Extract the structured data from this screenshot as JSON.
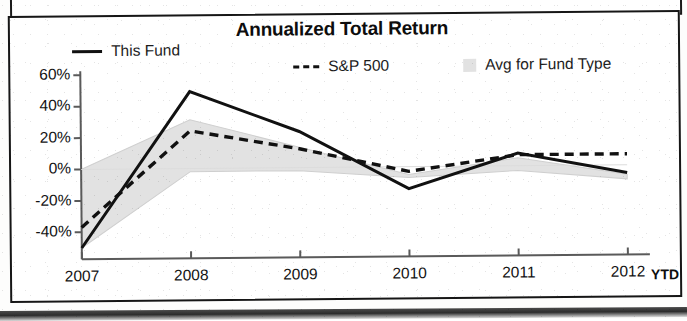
{
  "chart_data": {
    "type": "line",
    "title": "Annualized Total Return",
    "xlabel": "",
    "ylabel": "",
    "categories": [
      "2007",
      "2008",
      "2009",
      "2010",
      "2011",
      "2012"
    ],
    "x_axis_suffix": "YTD",
    "ylim": [
      -60,
      60
    ],
    "ytick_labels": [
      "60%",
      "40%",
      "20%",
      "0%",
      "-20%",
      "-40%"
    ],
    "ytick_values": [
      60,
      40,
      20,
      0,
      -20,
      -40
    ],
    "grid": false,
    "legend_position": "top",
    "series": [
      {
        "name": "This Fund",
        "style": "solid",
        "color": "#111111",
        "values": [
          -50,
          49,
          23,
          -14,
          8,
          -5
        ]
      },
      {
        "name": "S&P 500",
        "style": "dashed",
        "color": "#111111",
        "values": [
          -37,
          24,
          12,
          -3,
          7,
          7
        ]
      },
      {
        "name": "Avg for Fund Type",
        "style": "band",
        "color": "#e2e2e2",
        "upper_values": [
          0,
          31,
          13,
          -5,
          5,
          -6
        ],
        "lower_values": [
          -50,
          -2,
          -2,
          -7,
          -3,
          -9
        ]
      }
    ]
  },
  "legend": {
    "this_fund": "This Fund",
    "sp500": "S&P 500",
    "avg_for_fund_type": "Avg for Fund Type"
  },
  "colors": {
    "line": "#111111",
    "band": "#e2e2e2",
    "axis": "#5a5a5a",
    "frame": "#161616",
    "text": "#121212"
  }
}
